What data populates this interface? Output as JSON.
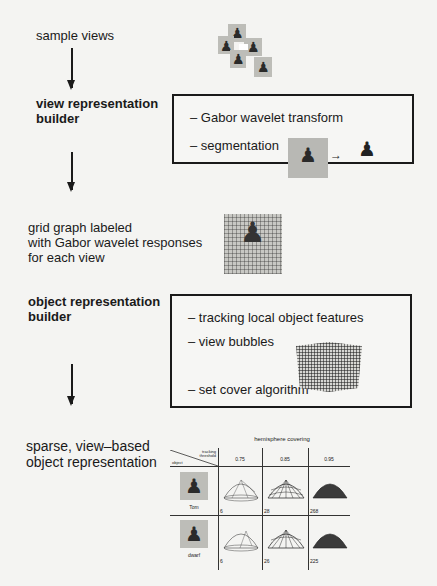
{
  "pipeline": {
    "sample_views_label": "sample views",
    "view_builder": {
      "title_line1": "view representation",
      "title_line2": "builder",
      "items": [
        "– Gabor wavelet transform",
        "– segmentation"
      ]
    },
    "grid_graph_label": {
      "line1": "grid graph labeled",
      "line2": "with Gabor wavelet responses",
      "line3": "for each view"
    },
    "object_builder": {
      "title_line1": "object representation",
      "title_line2": "builder",
      "items": [
        "– tracking local object features",
        "– view bubbles",
        "– set cover algorithm"
      ]
    },
    "output_label": {
      "line1": "sparse, view–based",
      "line2": "object representation"
    }
  },
  "table": {
    "title": "hemisphere covering",
    "corner_top": "tracking threshold",
    "corner_bottom": "object",
    "thresholds": [
      "0.75",
      "0.85",
      "0.95"
    ],
    "rows": [
      {
        "object": "Tom",
        "counts": [
          "6",
          "28",
          "268"
        ]
      },
      {
        "object": "dwarf",
        "counts": [
          "6",
          "26",
          "225"
        ]
      }
    ]
  },
  "icons": {
    "figure": "♟",
    "arrow_right": "→"
  }
}
